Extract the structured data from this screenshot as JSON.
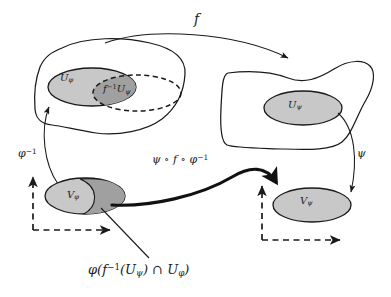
{
  "diagram": {
    "background_color": "#ffffff",
    "stroke_color": "#1a1a1a",
    "fill_light": "#c8c8c8",
    "fill_dark": "#a0a0a0",
    "labels": {
      "map_f": "f",
      "chart_domain_phi": "U",
      "chart_domain_phi_sub": "φ",
      "preimage_label_main": "f",
      "preimage_label_sup": "−1",
      "preimage_label_body": "U",
      "preimage_label_sub": "ψ",
      "chart_domain_psi": "U",
      "chart_domain_psi_sub": "ψ",
      "phi_inverse": "φ",
      "phi_inverse_sup": "−1",
      "transition_map": "ψ ∘ f ∘ φ",
      "transition_map_sup": "−1",
      "psi": "ψ",
      "image_phi": "V",
      "image_phi_sub": "φ",
      "image_psi": "V",
      "image_psi_sub": "ψ",
      "caption": "φ(f",
      "caption_sup": "−1",
      "caption_rest": "(U",
      "caption_sub1": "ψ",
      "caption_mid": ") ∩ U",
      "caption_sub2": "φ",
      "caption_end": ")"
    },
    "regions": [
      {
        "name": "source-manifold-blob",
        "shape": "amoeba",
        "filled": false
      },
      {
        "name": "target-manifold-blob",
        "shape": "amoeba-concave-top",
        "filled": false
      },
      {
        "name": "U-phi-ellipse",
        "shape": "ellipse",
        "fill": "#c8c8c8",
        "dashed": false
      },
      {
        "name": "f-inverse-U-psi-ellipse",
        "shape": "ellipse",
        "fill": "#c8c8c8",
        "dashed": true
      },
      {
        "name": "intersection-region",
        "shape": "lens",
        "fill": "#a0a0a0"
      },
      {
        "name": "U-psi-ellipse",
        "shape": "ellipse",
        "fill": "#c8c8c8",
        "dashed": false
      },
      {
        "name": "V-phi-ellipse",
        "shape": "ellipse",
        "fill": "#c8c8c8",
        "dashed": false
      },
      {
        "name": "V-phi-dark-crescent",
        "shape": "crescent",
        "fill": "#a0a0a0"
      },
      {
        "name": "V-psi-ellipse",
        "shape": "ellipse",
        "fill": "#c8c8c8",
        "dashed": false
      }
    ],
    "arrows": [
      {
        "name": "f-arrow",
        "from": "source-manifold-blob",
        "to": "target-manifold-blob",
        "style": "thin-curved"
      },
      {
        "name": "phi-inverse-arrow",
        "from": "V-phi-ellipse",
        "to": "U-phi-ellipse",
        "style": "thin-curved"
      },
      {
        "name": "psi-arrow",
        "from": "U-psi-ellipse",
        "to": "V-psi-ellipse",
        "style": "thin-curved"
      },
      {
        "name": "transition-arrow",
        "from": "V-phi-ellipse",
        "to": "V-psi-ellipse",
        "style": "thick-curved"
      },
      {
        "name": "caption-leader-line",
        "from": "caption",
        "to": "V-phi-dark-crescent",
        "style": "thin-straight"
      },
      {
        "name": "left-axes",
        "style": "dashed-L-axes"
      },
      {
        "name": "right-axes",
        "style": "dashed-L-axes"
      }
    ]
  }
}
